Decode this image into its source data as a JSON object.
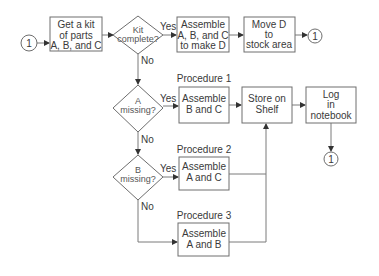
{
  "connectors": {
    "start": "1",
    "end_top": "1",
    "end_log": "1"
  },
  "nodes": {
    "get_kit": {
      "lines": [
        "Get a kit",
        "of parts",
        "A, B, and C"
      ]
    },
    "kit_complete": {
      "lines": [
        "Kit",
        "complete?"
      ]
    },
    "assemble_abc": {
      "lines": [
        "Assemble",
        "A, B, and C",
        "to make D"
      ]
    },
    "move_d": {
      "lines": [
        "Move D",
        "to",
        "stock area"
      ]
    },
    "a_missing": {
      "lines": [
        "A",
        "missing?"
      ]
    },
    "assemble_bc": {
      "title": "Procedure 1",
      "lines": [
        "Assemble",
        "B and C"
      ]
    },
    "store_shelf": {
      "lines": [
        "Store on",
        "Shelf"
      ]
    },
    "log_notebook": {
      "lines": [
        "Log",
        "in",
        "notebook"
      ]
    },
    "b_missing": {
      "lines": [
        "B",
        "missing?"
      ]
    },
    "assemble_ac": {
      "title": "Procedure 2",
      "lines": [
        "Assemble",
        "A and C"
      ]
    },
    "assemble_ab": {
      "title": "Procedure 3",
      "lines": [
        "Assemble",
        "A and B"
      ]
    }
  },
  "edge_labels": {
    "yes": "Yes",
    "no": "No"
  },
  "colors": {
    "stroke": "#6e6e6e",
    "text": "#3a3a3a",
    "background": "#ffffff"
  }
}
